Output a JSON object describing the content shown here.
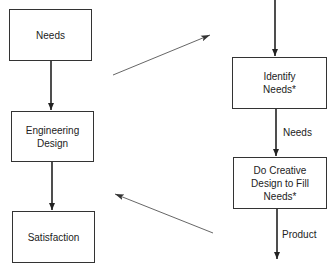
{
  "left_flow": {
    "boxes": [
      {
        "label": "Needs"
      },
      {
        "label": "Engineering Design"
      },
      {
        "label": "Satisfaction"
      }
    ]
  },
  "right_flow": {
    "boxes": [
      {
        "label": "Identify Needs*"
      },
      {
        "label": "Do Creative Design to Fill Needs*"
      }
    ],
    "edge_labels": {
      "between": "Needs",
      "output": "Product"
    }
  },
  "connectors": [
    {
      "from": "left-flow",
      "to": "right-flow",
      "direction": "up-right"
    },
    {
      "from": "right-flow",
      "to": "left-flow",
      "direction": "up-left"
    }
  ]
}
